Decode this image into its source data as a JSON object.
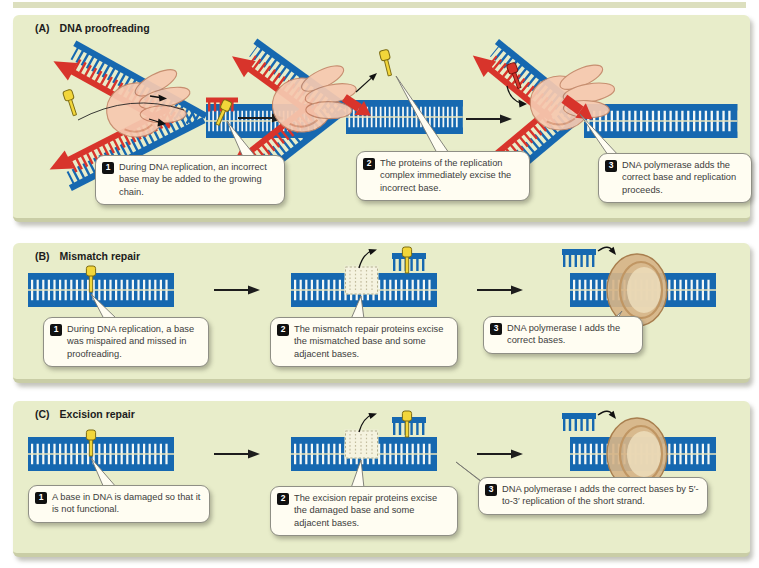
{
  "figure": {
    "panels": [
      {
        "label": "(A)",
        "title": "DNA proofreading",
        "steps": [
          {
            "num": "1",
            "text": "During DNA replication, an incorrect base may be added to the growing chain."
          },
          {
            "num": "2",
            "text": "The proteins of the replication complex immediately excise the incorrect base."
          },
          {
            "num": "3",
            "text": "DNA polymerase adds the correct base and replication proceeds."
          }
        ]
      },
      {
        "label": "(B)",
        "title": "Mismatch repair",
        "steps": [
          {
            "num": "1",
            "text": "During DNA replication, a base was mispaired and missed in proofreading."
          },
          {
            "num": "2",
            "text": "The mismatch repair proteins excise the mismatched base and some adjacent bases."
          },
          {
            "num": "3",
            "text": "DNA polymerase I adds the correct bases."
          }
        ]
      },
      {
        "label": "(C)",
        "title": "Excision repair",
        "steps": [
          {
            "num": "1",
            "text": "A base in DNA is damaged so that it is not functional."
          },
          {
            "num": "2",
            "text": "The excision repair proteins excise the damaged base and some adjacent bases."
          },
          {
            "num": "3",
            "text": "DNA polymerase I adds the correct bases by 5′-to-3′ replication of the short strand."
          }
        ]
      }
    ],
    "colors": {
      "panel_bg": "#e8edca",
      "dna_blue": "#1668b0",
      "new_strand_red": "#d8342b",
      "damaged_base_yellow": "#f2d63a",
      "polymerase_pink": "#f6c9b0",
      "clamp_tan": "#d6b488",
      "callout_bg": "#fffdf2"
    }
  }
}
